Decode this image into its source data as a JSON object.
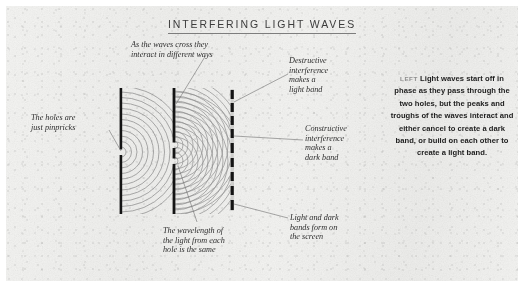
{
  "figure": {
    "title": "INTERFERING LIGHT WAVES",
    "type": "double-slit-interference-diagram",
    "background_color": "#f2f2f0",
    "ink_color": "#1a1a1a",
    "wave_color": "#8a8a8a",
    "leader_color": "#7a7a7a"
  },
  "annotations": {
    "holes": "The holes are\njust pinpricks",
    "crossing": "As the waves cross they\ninteract in different ways",
    "destructive": "Destructive\ninterference\nmakes a\nlight band",
    "constructive": "Constructive\ninterference\nmakes a\ndark band",
    "wavelength": "The wavelength of\nthe light from each\nhole is the same",
    "bands": "Light and dark\nbands form on\nthe screen"
  },
  "caption": {
    "lead": "LEFT",
    "text": "Light waves start off in phase as they pass through the two holes, but the peaks and troughs of the waves interact and either cancel to create a dark band, or build on each other to create a light band."
  },
  "diagram_elements": {
    "source_barrier_label": "single-pinhole-barrier",
    "slit_barrier_label": "double-pinhole-barrier",
    "screen_label": "projection-screen",
    "source_hole_count": 1,
    "slit_hole_count": 2,
    "screen_band_count": 9
  }
}
